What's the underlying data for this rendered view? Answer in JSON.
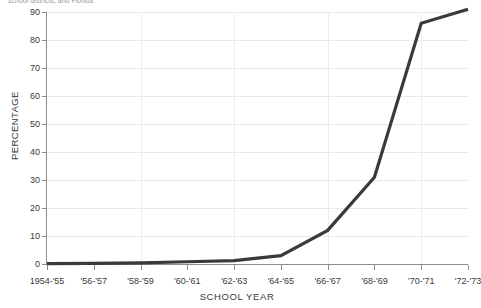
{
  "caption_fragment": "school districts, and Florida.",
  "chart_data": {
    "type": "line",
    "title": "",
    "xlabel": "SCHOOL YEAR",
    "ylabel": "PERCENTAGE",
    "categories": [
      "1954-'55",
      "'56-'57",
      "'58-'59",
      "'60-'61",
      "'62-'63",
      "'64-'65",
      "'66-'67",
      "'68-'69",
      "'70-'71",
      "'72-'73"
    ],
    "values": [
      0.1,
      0.2,
      0.4,
      0.8,
      1.2,
      3.0,
      12.0,
      31.0,
      86.0,
      91.0
    ],
    "ylim": [
      0,
      90
    ],
    "yticks": [
      0,
      10,
      20,
      30,
      40,
      50,
      60,
      70,
      80,
      90
    ],
    "ytick_labels": [
      "0",
      "10",
      "20",
      "30",
      "40",
      "50",
      "60",
      "70",
      "80",
      "90"
    ],
    "grid": true,
    "legend": false,
    "series_color": "#3a3a3a",
    "grid_color": "#e9e9e9",
    "axis_color": "#8d8d8d"
  }
}
